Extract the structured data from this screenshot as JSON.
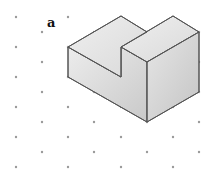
{
  "figure": {
    "label": "a",
    "colors": {
      "dot": "#9a9a9a",
      "edge": "#555555",
      "face_top": "#e2e2e2",
      "face_left": "#d6d6d6",
      "face_right": "#cacaca"
    }
  }
}
